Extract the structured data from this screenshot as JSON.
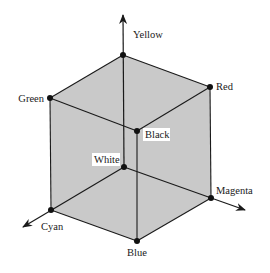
{
  "diagram": {
    "fill_color": "#c9c9c9",
    "line_color": "#1a1a1a",
    "vertices": {
      "yellow": {
        "label": "Yellow",
        "x": 123,
        "y": 55
      },
      "green": {
        "label": "Green",
        "x": 50,
        "y": 98
      },
      "red": {
        "label": "Red",
        "x": 210,
        "y": 87
      },
      "black": {
        "label": "Black",
        "x": 137,
        "y": 131
      },
      "white": {
        "label": "White",
        "x": 124,
        "y": 167
      },
      "magenta": {
        "label": "Magenta",
        "x": 211,
        "y": 198
      },
      "cyan": {
        "label": "Cyan",
        "x": 51,
        "y": 210
      },
      "blue": {
        "label": "Blue",
        "x": 137,
        "y": 241
      }
    },
    "axes": [
      {
        "name": "yellow-axis",
        "from": "white",
        "to_x": 123,
        "to_y": 15
      },
      {
        "name": "magenta-axis",
        "from": "white",
        "to_x": 245,
        "to_y": 210
      },
      {
        "name": "cyan-axis",
        "from": "white",
        "to_x": 23,
        "to_y": 227
      }
    ]
  }
}
